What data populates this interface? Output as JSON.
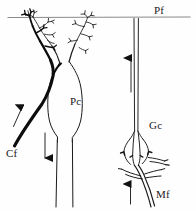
{
  "figure": {
    "background_color": "#fefefe",
    "ink_color": "#1a1a1a",
    "width": 196,
    "height": 212
  },
  "labels": {
    "pf": "Pf",
    "pc": "Pc",
    "cf": "Cf",
    "gc": "Gc",
    "mf": "Mf"
  },
  "structures": {
    "parallel_fiber": {
      "name": "Pf",
      "description": "horizontal parallel fiber running across the top of the molecular layer"
    },
    "purkinje_cell": {
      "name": "Pc",
      "description": "Purkinje cell with flask-shaped soma, two ascending dendritic trees and a descending axon"
    },
    "climbing_fiber": {
      "name": "Cf",
      "description": "thick climbing fiber ascending from lower left, wrapping the Purkinje soma and left dendrite"
    },
    "granule_cell": {
      "name": "Gc",
      "description": "granule cell with small soma, claw-shaped dendrites and an ascending axon bifurcating into the parallel fiber"
    },
    "mossy_fiber": {
      "name": "Mf",
      "description": "mossy fiber ascending from the bottom, terminating in a rosette contacting granule cell dendrites"
    }
  },
  "arrows": [
    {
      "name": "climbing-fiber-arrow",
      "direction": "up-right",
      "near": "Cf"
    },
    {
      "name": "purkinje-axon-arrow",
      "direction": "down",
      "near": "Pc axon"
    },
    {
      "name": "granule-axon-arrow",
      "direction": "up",
      "near": "Gc axon"
    },
    {
      "name": "mossy-fiber-arrow",
      "direction": "up",
      "near": "Mf"
    }
  ]
}
